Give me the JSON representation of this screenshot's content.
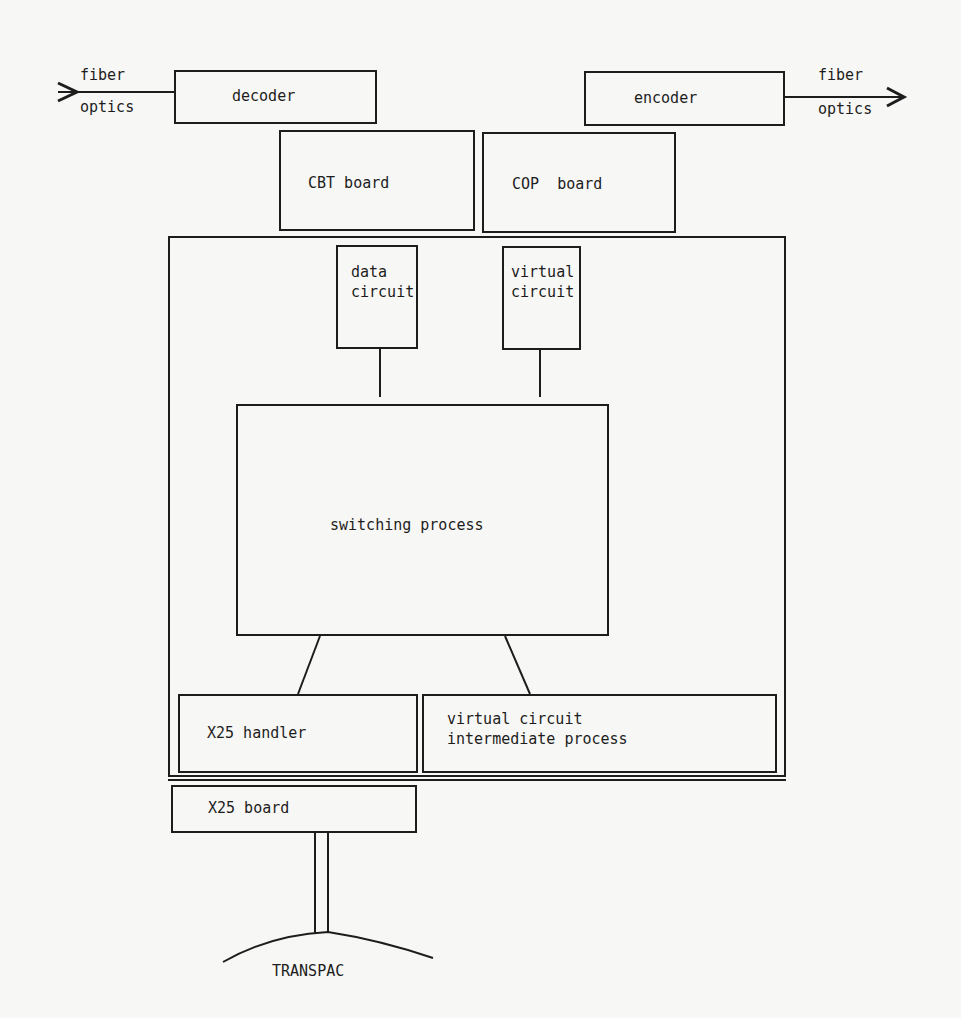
{
  "diagram": {
    "input": {
      "line1": "fiber",
      "line2": "optics"
    },
    "output": {
      "line1": "fiber",
      "line2": "optics"
    },
    "decoder": {
      "label": "decoder"
    },
    "encoder": {
      "label": "encoder"
    },
    "cbt_board": {
      "label": "CBT board"
    },
    "cop_board": {
      "label": "COP  board"
    },
    "data_circuit": {
      "line1": "data",
      "line2": "circuit"
    },
    "virtual_circuit": {
      "line1": "virtual",
      "line2": "circuit"
    },
    "switching_process": {
      "label": "switching process"
    },
    "x25_handler": {
      "label": "X25 handler"
    },
    "vc_intermediate": {
      "line1": "virtual circuit",
      "line2": "intermediate process"
    },
    "x25_board": {
      "label": "X25 board"
    },
    "network": {
      "label": "TRANSPAC"
    }
  },
  "colors": {
    "ink": "#1d1d1d",
    "paper": "#f7f7f5"
  }
}
